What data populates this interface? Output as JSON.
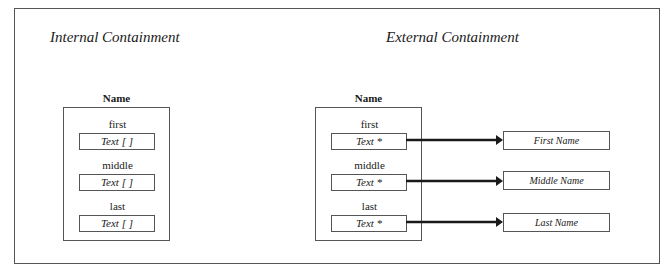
{
  "internal": {
    "title": "Internal Containment",
    "struct_name": "Name",
    "fields": [
      {
        "label": "first",
        "value": "Text [ ]"
      },
      {
        "label": "middle",
        "value": "Text [ ]"
      },
      {
        "label": "last",
        "value": "Text [ ]"
      }
    ]
  },
  "external": {
    "title": "External Containment",
    "struct_name": "Name",
    "fields": [
      {
        "label": "first",
        "value": "Text *",
        "target": "First Name"
      },
      {
        "label": "middle",
        "value": "Text *",
        "target": "Middle Name"
      },
      {
        "label": "last",
        "value": "Text *",
        "target": "Last Name"
      }
    ]
  }
}
